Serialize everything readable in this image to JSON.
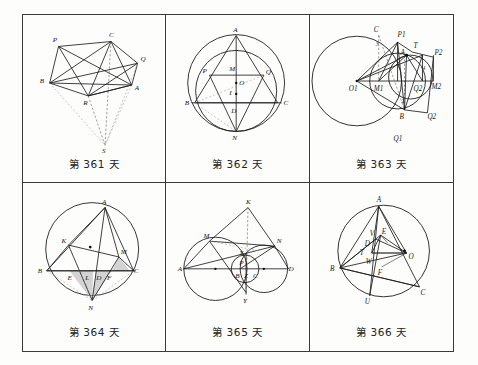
{
  "page": {
    "layout": {
      "rows": 2,
      "cols": 3
    },
    "background_color": "#fdfdfc",
    "ink_color": "#1d1d1d",
    "shade_color": "#b9b9b9"
  },
  "panels": [
    {
      "id": "panel-361",
      "caption": "第 361 天",
      "figure_type": "polygon-network-with-apex",
      "point_labels": [
        "P",
        "C",
        "Q",
        "B",
        "A",
        "R",
        "S"
      ]
    },
    {
      "id": "panel-362",
      "caption": "第 362 天",
      "figure_type": "two-circles-triangle-incenter",
      "point_labels": [
        "A",
        "P",
        "M",
        "Q",
        "O",
        "B",
        "I",
        "C",
        "D",
        "N"
      ]
    },
    {
      "id": "panel-363",
      "caption": "第 363 天",
      "figure_type": "two-circles-tangent-construction",
      "point_labels": [
        "C",
        "P1",
        "T",
        "A",
        "P2",
        "O1",
        "M1",
        "Q2",
        "M2",
        "B",
        "Q1"
      ],
      "angle_marks": [
        "3",
        "1",
        "4",
        "2"
      ]
    },
    {
      "id": "panel-364",
      "caption": "第 364 天",
      "figure_type": "circumcircle-with-shaded-triangles",
      "point_labels": [
        "A",
        "K",
        "M",
        "B",
        "E",
        "L",
        "D",
        "F",
        "C",
        "N"
      ]
    },
    {
      "id": "panel-365",
      "caption": "第 365 天",
      "figure_type": "three-tangent-circles-apex",
      "point_labels": [
        "K",
        "M",
        "N",
        "X",
        "P",
        "A",
        "B",
        "Z",
        "C",
        "D",
        "Y"
      ]
    },
    {
      "id": "panel-366",
      "caption": "第 366 天",
      "figure_type": "circumcircle-cevians-center",
      "point_labels": [
        "A",
        "V",
        "E",
        "D",
        "T",
        "O",
        "B",
        "W",
        "F",
        "U",
        "C"
      ]
    }
  ]
}
